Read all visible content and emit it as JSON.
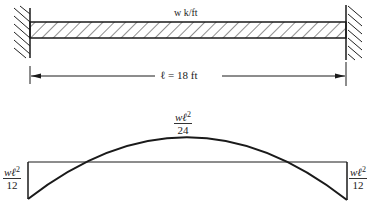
{
  "beam": {
    "load_label": "w k/ft",
    "span_label": "ℓ = 18 ft",
    "supports": [
      "fixed",
      "fixed"
    ]
  },
  "moment_diagram": {
    "left_end": {
      "numerator": "wℓ",
      "exponent": "2",
      "denominator": "12"
    },
    "midspan": {
      "numerator": "wℓ",
      "exponent": "2",
      "denominator": "24"
    },
    "right_end": {
      "numerator": "wℓ",
      "exponent": "2",
      "denominator": "12"
    }
  },
  "colors": {
    "line": "#1a1a1a",
    "background": "#ffffff"
  }
}
